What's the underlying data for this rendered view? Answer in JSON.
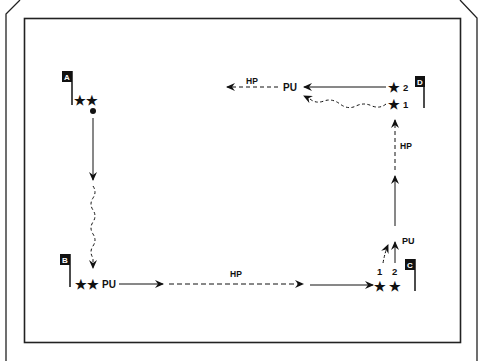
{
  "diagram": {
    "type": "drill-diagram",
    "colors": {
      "line": "#111111",
      "background": "#ffffff",
      "flag_fill": "#111111",
      "flag_text": "#ffffff"
    },
    "stations": [
      {
        "id": "A",
        "label": "A",
        "players": 2
      },
      {
        "id": "B",
        "label": "B",
        "players": 2,
        "action": "PU"
      },
      {
        "id": "C",
        "label": "C",
        "players": 2,
        "player_labels": [
          "1",
          "2"
        ],
        "action": "PU"
      },
      {
        "id": "D",
        "label": "D",
        "players": 2,
        "player_labels": [
          "2",
          "1"
        ],
        "action": "PU"
      }
    ],
    "labels": {
      "a_to_b": "",
      "b_pu": "PU",
      "b_to_c_hp": "HP",
      "c_pu": "PU",
      "c_p1": "1",
      "c_p2": "2",
      "c_to_d_hp": "HP",
      "d_p2": "2",
      "d_p1": "1",
      "d_pu": "PU",
      "d_hp": "HP"
    },
    "legend": {
      "solid_arrow": "run",
      "dashed_arrow": "hard pace",
      "wavy_arrow": "jog",
      "PU": "pick up",
      "HP": "hard pace"
    }
  }
}
